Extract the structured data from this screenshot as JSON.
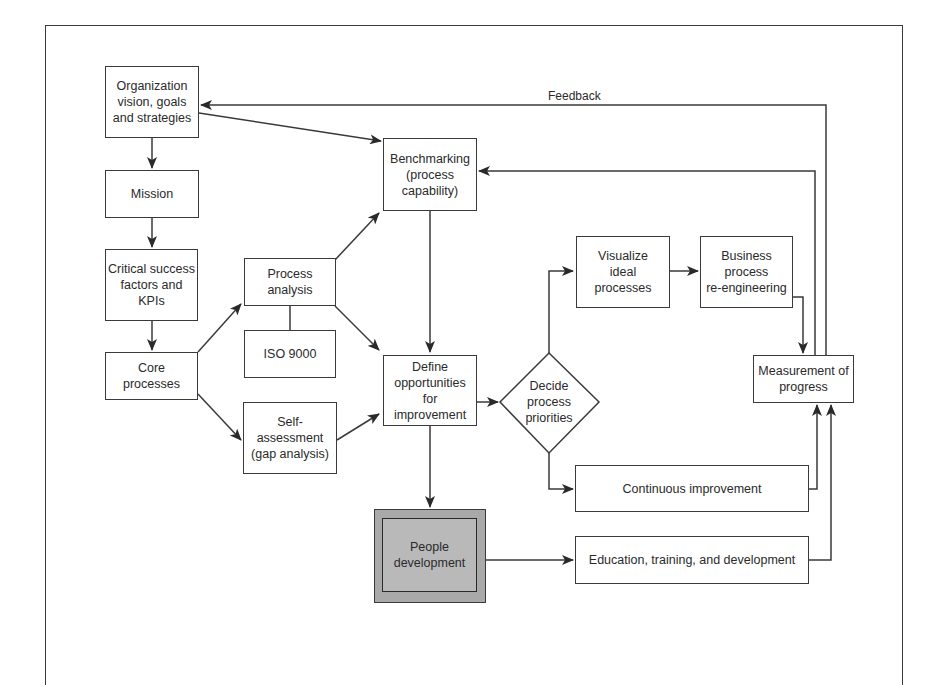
{
  "diagram": {
    "feedback_label": "Feedback",
    "nodes": {
      "org_vision": "Organization\nvision, goals\nand strategies",
      "mission": "Mission",
      "csf": "Critical success\nfactors and\nKPIs",
      "core": "Core\nprocesses",
      "process_analysis": "Process\nanalysis",
      "iso9000": "ISO 9000",
      "self_assessment": "Self-\nassessment\n(gap analysis)",
      "benchmarking": "Benchmarking\n(process\ncapability)",
      "define_opps": "Define\nopportunities\nfor\nimprovement",
      "decide_priorities": "Decide\nprocess\npriorities",
      "visualize": "Visualize\nideal\nprocesses",
      "bpr": "Business\nprocess\nre-engineering",
      "measurement": "Measurement of\nprogress",
      "continuous": "Continuous improvement",
      "people_dev": "People\ndevelopment",
      "education": "Education, training, and development"
    },
    "colors": {
      "line": "#3a3a3a",
      "people_outer_fill": "#a9a9a9",
      "people_inner_fill": "#b9b9b9"
    },
    "edges": [
      {
        "from": "org_vision",
        "to": "mission"
      },
      {
        "from": "mission",
        "to": "csf"
      },
      {
        "from": "csf",
        "to": "core"
      },
      {
        "from": "org_vision",
        "to": "benchmarking"
      },
      {
        "from": "core",
        "to": "process_analysis"
      },
      {
        "from": "core",
        "to": "self_assessment"
      },
      {
        "from": "process_analysis",
        "to": "iso9000",
        "arrow": false
      },
      {
        "from": "process_analysis",
        "to": "benchmarking"
      },
      {
        "from": "process_analysis",
        "to": "define_opps"
      },
      {
        "from": "self_assessment",
        "to": "define_opps"
      },
      {
        "from": "benchmarking",
        "to": "define_opps"
      },
      {
        "from": "define_opps",
        "to": "decide_priorities"
      },
      {
        "from": "define_opps",
        "to": "people_dev"
      },
      {
        "from": "decide_priorities",
        "to": "visualize"
      },
      {
        "from": "decide_priorities",
        "to": "continuous"
      },
      {
        "from": "visualize",
        "to": "bpr"
      },
      {
        "from": "bpr",
        "to": "measurement"
      },
      {
        "from": "continuous",
        "to": "measurement"
      },
      {
        "from": "people_dev",
        "to": "education"
      },
      {
        "from": "education",
        "to": "measurement"
      },
      {
        "from": "measurement",
        "to": "benchmarking"
      },
      {
        "from": "measurement",
        "to": "org_vision",
        "label": "Feedback"
      }
    ]
  }
}
